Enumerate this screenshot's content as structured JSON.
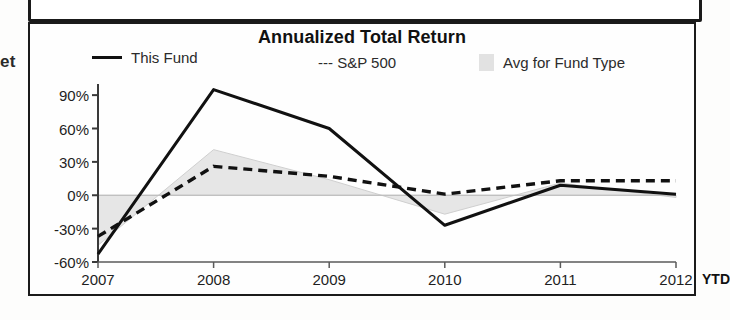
{
  "fragments": {
    "left_cut_text": "et"
  },
  "chart": {
    "title": "Annualized Total Return",
    "legend": [
      {
        "label": "This Fund",
        "marker": "solid-line",
        "color": "#111111"
      },
      {
        "label": "--- S&P 500",
        "marker": "dashed-line",
        "color": "#111111"
      },
      {
        "label": "Avg for Fund Type",
        "marker": "area-swatch",
        "color": "#e2e2e2"
      }
    ],
    "ytd_note": "YTD"
  },
  "chart_data": {
    "type": "line",
    "title": "Annualized Total Return",
    "xlabel": "",
    "ylabel": "",
    "categories": [
      "2007",
      "2008",
      "2009",
      "2010",
      "2011",
      "2012"
    ],
    "ylim": [
      -60,
      100
    ],
    "yticks": [
      90,
      60,
      30,
      0,
      -30,
      -60
    ],
    "ytick_labels": [
      "90%",
      "60%",
      "30%",
      "0%",
      "-30%",
      "-60%"
    ],
    "grid": false,
    "legend_position": "top",
    "series": [
      {
        "name": "This Fund",
        "style": "solid",
        "color": "#111111",
        "values": [
          -53,
          95,
          60,
          -27,
          9,
          1
        ]
      },
      {
        "name": "S&P 500",
        "style": "dashed",
        "color": "#111111",
        "values": [
          -37,
          26,
          17,
          1,
          13,
          13
        ]
      },
      {
        "name": "Avg for Fund Type",
        "style": "filled-area",
        "color": "#e6e6e6",
        "values": [
          -45,
          41,
          14,
          -17,
          11,
          -2
        ]
      }
    ],
    "notes": [
      "Last category is year-to-date (YTD)"
    ]
  }
}
